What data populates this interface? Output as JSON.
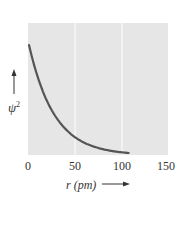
{
  "chart_data": {
    "type": "line",
    "title": "",
    "xlabel": "r (pm)",
    "ylabel": "ψ²",
    "xlim": [
      0,
      150
    ],
    "xticks": [
      "0",
      "50",
      "100",
      "150"
    ],
    "grid": "vertical white lines at x=50 and x=100",
    "series": [
      {
        "name": "ψ² vs r (exponential decay)",
        "color": "#555555",
        "x": [
          0,
          5,
          10,
          20,
          30,
          40,
          50,
          60,
          70,
          80,
          90,
          100,
          106
        ],
        "y": [
          1.0,
          0.83,
          0.69,
          0.48,
          0.33,
          0.23,
          0.16,
          0.11,
          0.07,
          0.05,
          0.03,
          0.015,
          0.0
        ]
      }
    ]
  },
  "axis": {
    "x_label": "r (pm)",
    "y_label_base": "ψ",
    "y_label_exp": "2",
    "ticks": [
      "0",
      "50",
      "100",
      "150"
    ]
  },
  "colors": {
    "plot_bg": "#e6e6e6",
    "curve": "#555555",
    "grid": "#ffffff"
  }
}
